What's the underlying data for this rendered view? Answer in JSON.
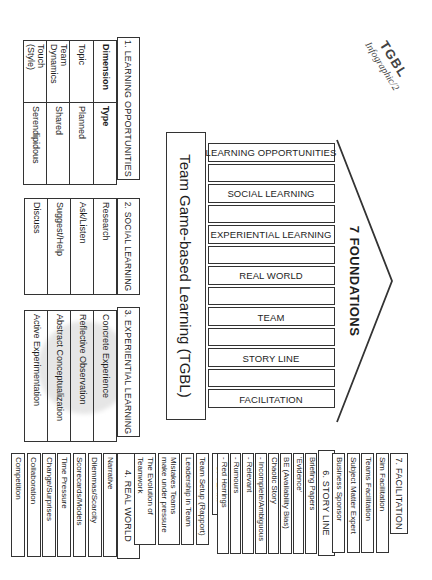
{
  "logo": {
    "title": "TGBL",
    "subtitle": "Infographic/2"
  },
  "figure": {
    "title": "Team Game-based Learning (TGBL)",
    "roof_label": "7 FOUNDATIONS",
    "pillars": [
      "LEARNING OPPORTUNITIES",
      "SOCIAL LEARNING",
      "EXPERIENTIAL LEARNING",
      "REAL WORLD",
      "TEAM",
      "STORY LINE",
      "FACILITATION"
    ]
  },
  "sections": {
    "s1": {
      "title": "1. LEARNING OPPORTUNITIES",
      "table": {
        "col1_header": "Dimension",
        "col2_header": "Type",
        "rows": [
          {
            "dimension": "Topic",
            "type": "Planned"
          },
          {
            "dimension": "Team\nDynamics",
            "type": "Shared"
          },
          {
            "dimension": "Touch\n(Style)",
            "type": "Serendipidous"
          }
        ]
      }
    },
    "s2": {
      "title": "2. SOCIAL LEARNING",
      "items": [
        "Research",
        "Ask/Listen",
        "Suggest/Help",
        "Discuss"
      ]
    },
    "s3": {
      "title": "3. EXPERIENTIAL LEARNING",
      "items": [
        "Concrete Experience",
        "Reflective Observation",
        "Abstract Conceptualization",
        "Active Experimentation"
      ]
    },
    "s4": {
      "title": "4. REAL WORLD",
      "items": [
        "Narrative",
        "Dilemmas/Scarcity",
        "Scorecards/Models",
        "Time Pressure",
        "Change/Surprises",
        "Collaboration",
        "Competition"
      ]
    },
    "s5": {
      "title": "5. TEAM",
      "items": [
        "Team Setup (Rapport)",
        "Leadership in Team",
        "Mistakes Teams\nmake under pressure",
        "The Evolution of\nTeamwork"
      ]
    },
    "s6": {
      "title": "6. STORY LINE",
      "items": [
        "Briefing Papers",
        "'Evidence'",
        "BE (Availability Bias)",
        "Chaotic Story",
        "- Incomplete/Ambiguous",
        "- Relevant",
        "- Rumours",
        "- Red Herrings"
      ]
    },
    "s7": {
      "title": "7. FACILITATION",
      "items": [
        "Sim Facilitation",
        "Teams Facilitation",
        "Subject Matter Expert",
        "Business Sponsor"
      ]
    }
  },
  "colors": {
    "ink": "#1d1d1d",
    "border": "#333333",
    "watermark": "#e6e6e6"
  }
}
